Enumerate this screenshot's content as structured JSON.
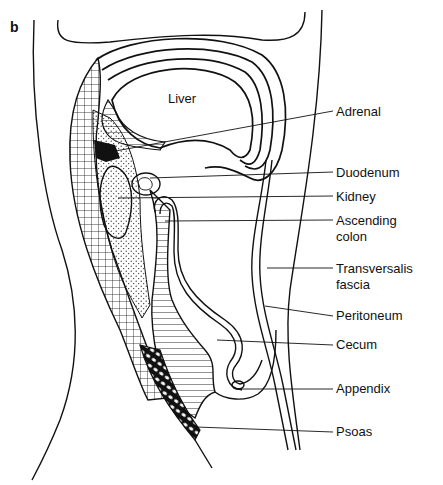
{
  "figure": {
    "panel_label": "b",
    "organ_label_inside": "Liver"
  },
  "labels": [
    {
      "id": "adrenal",
      "text": "Adrenal"
    },
    {
      "id": "duodenum",
      "text": "Duodenum"
    },
    {
      "id": "kidney",
      "text": "Kidney"
    },
    {
      "id": "ascending-colon",
      "text": "Ascending",
      "text2": "colon"
    },
    {
      "id": "transversalis-fascia",
      "text": "Transversalis",
      "text2": "fascia"
    },
    {
      "id": "peritoneum",
      "text": "Peritoneum"
    },
    {
      "id": "cecum",
      "text": "Cecum"
    },
    {
      "id": "appendix",
      "text": "Appendix"
    },
    {
      "id": "psoas",
      "text": "Psoas"
    }
  ],
  "colors": {
    "ink": "#111111",
    "background": "#ffffff"
  }
}
